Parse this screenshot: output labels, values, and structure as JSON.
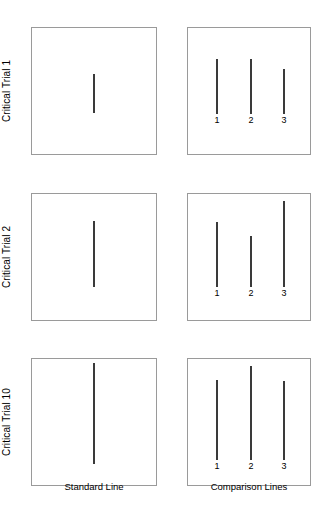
{
  "figure": {
    "panel_captions": {
      "standard": "Standard Line",
      "comparison": "Comparison Lines"
    },
    "line_color": "#3a3a3a",
    "box_border_color": "#9a9a9a",
    "background": "#ffffff"
  },
  "rows": [
    {
      "label": "Critical Trial 1",
      "box_top": 27,
      "standard": {
        "x": 93,
        "top": 73,
        "bottom": 112,
        "length": 39
      },
      "comparison": [
        {
          "id": "1",
          "x": 216,
          "top": 58,
          "bottom": 113,
          "length": 55,
          "label_y": 114
        },
        {
          "id": "2",
          "x": 250,
          "top": 58,
          "bottom": 113,
          "length": 55,
          "label_y": 114
        },
        {
          "id": "3",
          "x": 283,
          "top": 68,
          "bottom": 113,
          "length": 45,
          "label_y": 114
        }
      ]
    },
    {
      "label": "Critical Trial 2",
      "box_top": 193,
      "standard": {
        "x": 93,
        "top": 220,
        "bottom": 286,
        "length": 66
      },
      "comparison": [
        {
          "id": "1",
          "x": 216,
          "top": 221,
          "bottom": 286,
          "length": 65,
          "label_y": 287
        },
        {
          "id": "2",
          "x": 250,
          "top": 235,
          "bottom": 286,
          "length": 51,
          "label_y": 287
        },
        {
          "id": "3",
          "x": 283,
          "top": 200,
          "bottom": 286,
          "length": 86,
          "label_y": 287
        }
      ]
    },
    {
      "label": "Critical Trial 10",
      "box_top": 358,
      "standard": {
        "x": 93,
        "top": 362,
        "bottom": 463,
        "length": 101
      },
      "comparison": [
        {
          "id": "1",
          "x": 216,
          "top": 379,
          "bottom": 459,
          "length": 80,
          "label_y": 460
        },
        {
          "id": "2",
          "x": 250,
          "top": 365,
          "bottom": 459,
          "length": 94,
          "label_y": 460
        },
        {
          "id": "3",
          "x": 283,
          "top": 380,
          "bottom": 459,
          "length": 79,
          "label_y": 460
        }
      ]
    }
  ]
}
